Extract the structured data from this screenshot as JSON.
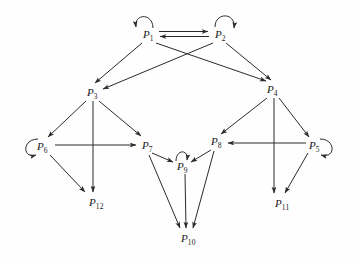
{
  "diagram": {
    "type": "directed-graph",
    "background_color": "#fefefe",
    "line_color": "#2b2b2b",
    "label_color": "#1a1a1a",
    "nodes": [
      {
        "id": "P1",
        "base": "P",
        "sub": "1",
        "x": 148,
        "y": 35,
        "self_loop": true
      },
      {
        "id": "P2",
        "base": "P",
        "sub": "2",
        "x": 220,
        "y": 35,
        "self_loop": true
      },
      {
        "id": "P3",
        "base": "P",
        "sub": "3",
        "x": 92,
        "y": 93,
        "self_loop": false
      },
      {
        "id": "P4",
        "base": "P",
        "sub": "4",
        "x": 272,
        "y": 90,
        "self_loop": false
      },
      {
        "id": "P5",
        "base": "P",
        "sub": "5",
        "x": 314,
        "y": 146,
        "self_loop": true
      },
      {
        "id": "P6",
        "base": "P",
        "sub": "6",
        "x": 42,
        "y": 147,
        "self_loop": true
      },
      {
        "id": "P7",
        "base": "P",
        "sub": "7",
        "x": 147,
        "y": 146,
        "self_loop": false
      },
      {
        "id": "P8",
        "base": "P",
        "sub": "8",
        "x": 216,
        "y": 142,
        "self_loop": false
      },
      {
        "id": "P9",
        "base": "P",
        "sub": "9",
        "x": 182,
        "y": 167,
        "self_loop": true
      },
      {
        "id": "P10",
        "base": "P",
        "sub": "10",
        "x": 186,
        "y": 239,
        "self_loop": false
      },
      {
        "id": "P11",
        "base": "P",
        "sub": "11",
        "x": 280,
        "y": 204,
        "self_loop": false
      },
      {
        "id": "P12",
        "base": "P",
        "sub": "12",
        "x": 94,
        "y": 203,
        "self_loop": false
      }
    ],
    "edges": [
      {
        "from": "P1",
        "to": "P2",
        "style": "parallel-top"
      },
      {
        "from": "P2",
        "to": "P1",
        "style": "parallel-bottom"
      },
      {
        "from": "P1",
        "to": "P3",
        "style": "straight"
      },
      {
        "from": "P1",
        "to": "P4",
        "style": "straight"
      },
      {
        "from": "P2",
        "to": "P3",
        "style": "straight"
      },
      {
        "from": "P2",
        "to": "P4",
        "style": "straight"
      },
      {
        "from": "P3",
        "to": "P6",
        "style": "straight"
      },
      {
        "from": "P3",
        "to": "P7",
        "style": "straight"
      },
      {
        "from": "P3",
        "to": "P12",
        "style": "straight"
      },
      {
        "from": "P6",
        "to": "P7",
        "style": "straight"
      },
      {
        "from": "P6",
        "to": "P12",
        "style": "straight"
      },
      {
        "from": "P7",
        "to": "P9",
        "style": "straight"
      },
      {
        "from": "P7",
        "to": "P10",
        "style": "straight"
      },
      {
        "from": "P8",
        "to": "P9",
        "style": "straight"
      },
      {
        "from": "P8",
        "to": "P10",
        "style": "straight"
      },
      {
        "from": "P9",
        "to": "P10",
        "style": "straight"
      },
      {
        "from": "P4",
        "to": "P8",
        "style": "straight"
      },
      {
        "from": "P4",
        "to": "P5",
        "style": "straight"
      },
      {
        "from": "P4",
        "to": "P11",
        "style": "straight"
      },
      {
        "from": "P5",
        "to": "P8",
        "style": "straight"
      },
      {
        "from": "P5",
        "to": "P11",
        "style": "straight"
      }
    ],
    "self_loops": [
      {
        "node": "P1",
        "position": "top-left"
      },
      {
        "node": "P2",
        "position": "top-right"
      },
      {
        "node": "P5",
        "position": "right"
      },
      {
        "node": "P6",
        "position": "left"
      },
      {
        "node": "P9",
        "position": "top"
      }
    ]
  }
}
